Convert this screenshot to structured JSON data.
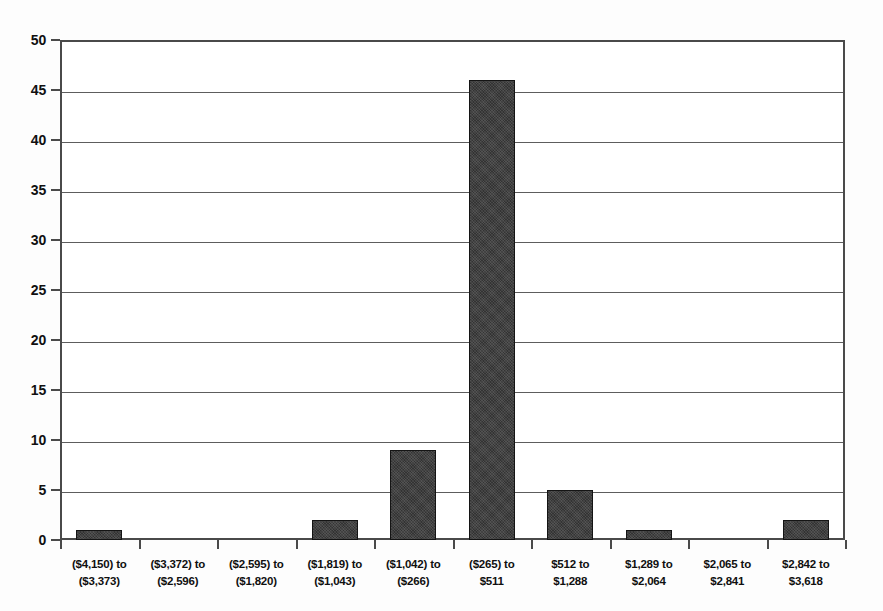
{
  "chart_data": {
    "type": "bar",
    "title": "",
    "xlabel": "",
    "ylabel": "",
    "categories": [
      "($4,150) to ($3,373)",
      "($3,372) to ($2,596)",
      "($2,595) to ($1,820)",
      "($1,819) to ($1,043)",
      "($1,042) to ($266)",
      "($265) to $511",
      "$512 to $1,288",
      "$1,289 to $2,064",
      "$2,065 to $2,841",
      "$2,842 to $3,618"
    ],
    "category_lines": [
      {
        "line1": "($4,150) to",
        "line2": "($3,373)"
      },
      {
        "line1": "($3,372) to",
        "line2": "($2,596)"
      },
      {
        "line1": "($2,595) to",
        "line2": "($1,820)"
      },
      {
        "line1": "($1,819) to",
        "line2": "($1,043)"
      },
      {
        "line1": "($1,042) to",
        "line2": "($266)"
      },
      {
        "line1": "($265) to",
        "line2": "$511"
      },
      {
        "line1": "$512 to",
        "line2": "$1,288"
      },
      {
        "line1": "$1,289 to",
        "line2": "$2,064"
      },
      {
        "line1": "$2,065 to",
        "line2": "$2,841"
      },
      {
        "line1": "$2,842 to",
        "line2": "$3,618"
      }
    ],
    "values": [
      1,
      0,
      0,
      2,
      9,
      46,
      5,
      1,
      0,
      2
    ],
    "ylim": [
      0,
      50
    ],
    "ytick_step": 5,
    "yticks": [
      0,
      5,
      10,
      15,
      20,
      25,
      30,
      35,
      40,
      45,
      50
    ],
    "ytick_labels": [
      "0",
      "5",
      "10",
      "15",
      "20",
      "25",
      "30",
      "35",
      "40",
      "45",
      "50"
    ],
    "grid": true,
    "legend": false,
    "legend_position": "none",
    "bar_color": "#333333",
    "axis_color": "#4a4a4a",
    "grid_color": "#5d5d5d",
    "background_color": "#ffffff"
  }
}
